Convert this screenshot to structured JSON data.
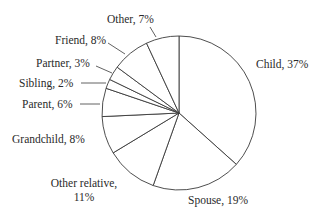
{
  "chart_data": {
    "type": "pie",
    "title": "",
    "start_angle_deg": 0,
    "direction": "clockwise",
    "center": [
      179,
      113
    ],
    "radius": 77,
    "slices": [
      {
        "label": "Child",
        "value": 37,
        "text": "Child, 37%",
        "lx": 256,
        "ly": 68,
        "anchor": "start",
        "leader": null
      },
      {
        "label": "Spouse",
        "value": 19,
        "text": "Spouse, 19%",
        "lx": 188,
        "ly": 204,
        "anchor": "start",
        "leader": null
      },
      {
        "label": "Other relative",
        "value": 11,
        "text": [
          "Other relative,",
          "11%"
        ],
        "lx": 84,
        "ly": 187,
        "anchor": "middle",
        "leader": null
      },
      {
        "label": "Grandchild",
        "value": 8,
        "text": "Grandchild, 8%",
        "lx": 12,
        "ly": 143,
        "anchor": "start",
        "leader": null
      },
      {
        "label": "Parent",
        "value": 6,
        "text": "Parent, 6%",
        "lx": 22,
        "ly": 108,
        "anchor": "start",
        "leader": [
          [
            80,
            104
          ],
          [
            100,
            104
          ]
        ]
      },
      {
        "label": "Sibling",
        "value": 2,
        "text": "Sibling, 2%",
        "lx": 19,
        "ly": 87,
        "anchor": "start",
        "leader": [
          [
            81,
            83
          ],
          [
            106,
            83
          ]
        ]
      },
      {
        "label": "Partner",
        "value": 3,
        "text": "Partner, 3%",
        "lx": 36,
        "ly": 67,
        "anchor": "start",
        "leader": [
          [
            96,
            66
          ],
          [
            112,
            73
          ]
        ]
      },
      {
        "label": "Friend",
        "value": 8,
        "text": "Friend, 8%",
        "lx": 55,
        "ly": 44,
        "anchor": "start",
        "leader": [
          [
            108,
            43
          ],
          [
            125,
            54
          ]
        ]
      },
      {
        "label": "Other",
        "value": 7,
        "text": "Other, 7%",
        "lx": 107,
        "ly": 23,
        "anchor": "start",
        "leader": [
          [
            150,
            27
          ],
          [
            156,
            37
          ]
        ]
      }
    ],
    "legend": null,
    "xlabel": "",
    "ylabel": ""
  },
  "colors": {
    "fill": "#ffffff",
    "stroke": "#3a3a3a",
    "text": "#2a2a2a"
  }
}
